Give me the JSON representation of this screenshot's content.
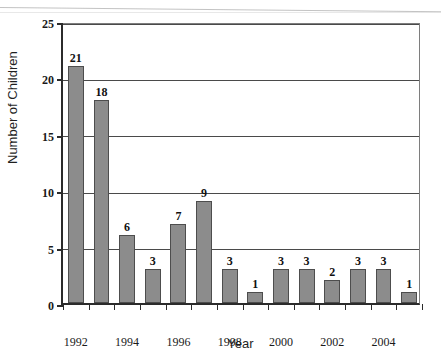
{
  "chart_data": {
    "type": "bar",
    "title": "",
    "xlabel": "Year",
    "ylabel": "Number of Children",
    "categories": [
      "1992",
      "1993",
      "1994",
      "1995",
      "1996",
      "1997",
      "1998",
      "1999",
      "2000",
      "2001",
      "2002",
      "2003",
      "2004",
      "2005"
    ],
    "values": [
      21,
      18,
      6,
      3,
      7,
      9,
      3,
      1,
      3,
      3,
      2,
      3,
      3,
      1
    ],
    "data_labels": [
      "21",
      "18",
      "6",
      "3",
      "7",
      "9",
      "3",
      "1",
      "3",
      "3",
      "2",
      "3",
      "3",
      "1"
    ],
    "ylim": [
      0,
      25
    ],
    "yticks": [
      0,
      5,
      10,
      15,
      20,
      25
    ],
    "ytick_labels": [
      "0",
      "5",
      "10",
      "15",
      "20",
      "25"
    ],
    "xtick_labels": [
      "1992",
      "1994",
      "1996",
      "1998",
      "2000",
      "2002",
      "2004"
    ],
    "xtick_categories": [
      "1992",
      "1994",
      "1996",
      "1998",
      "2000",
      "2002",
      "2004"
    ],
    "grid": "horizontal",
    "legend": "none",
    "bar_color": "#8c8c8c",
    "bar_edge_color": "#4d4d4d",
    "axis_color": "#2b2b2b",
    "grid_color": "#4a4a4a",
    "background": "#ffffff"
  }
}
